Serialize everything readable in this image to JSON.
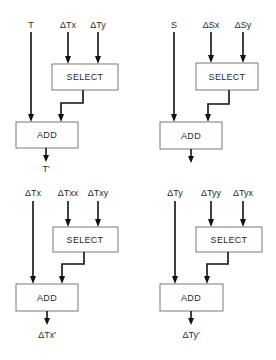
{
  "diagram": {
    "panels": [
      {
        "id": "t-update",
        "input_main": "T",
        "inputs_select": [
          "ΔTx",
          "ΔTy"
        ],
        "select_label": "SELECT",
        "add_label": "ADD",
        "output": "T′"
      },
      {
        "id": "s-update",
        "input_main": "S",
        "inputs_select": [
          "ΔSx",
          "ΔSy"
        ],
        "select_label": "SELECT",
        "add_label": "ADD",
        "output": ""
      },
      {
        "id": "dtx-update",
        "input_main": "ΔTx",
        "inputs_select": [
          "ΔTxx",
          "ΔTxy"
        ],
        "select_label": "SELECT",
        "add_label": "ADD",
        "output": "ΔTx′"
      },
      {
        "id": "dty-update",
        "input_main": "ΔTy",
        "inputs_select": [
          "ΔTyy",
          "ΔTyx"
        ],
        "select_label": "SELECT",
        "add_label": "ADD",
        "output": "ΔTy′"
      }
    ]
  }
}
